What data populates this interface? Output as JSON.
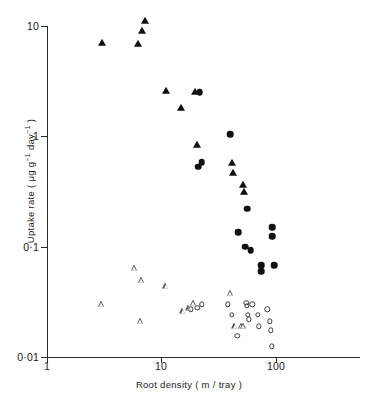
{
  "chart_data": {
    "type": "scatter",
    "title": "",
    "xlabel": "Root density ( m / tray )",
    "ylabel": "Uptake rate ( μg g⁻¹ day⁻¹ )",
    "xscale": "log",
    "yscale": "log",
    "xlim": [
      1,
      200
    ],
    "ylim": [
      0.01,
      10
    ],
    "xticks": [
      1,
      10,
      100
    ],
    "xticklabels": [
      "1",
      "10",
      "100"
    ],
    "yticks": [
      0.01,
      0.1,
      1,
      10
    ],
    "yticklabels": [
      "0·01",
      "0·1",
      "1",
      "10"
    ],
    "grid": false,
    "legend": "none",
    "series": [
      {
        "name": "filled-triangle",
        "marker": "filled-triangle",
        "color": "#111111",
        "points": [
          [
            3.0,
            7.0
          ],
          [
            6.2,
            6.9
          ],
          [
            6.8,
            9.0
          ],
          [
            7.2,
            11.0
          ],
          [
            11.0,
            2.6
          ],
          [
            14.8,
            1.8
          ],
          [
            19.5,
            2.5
          ],
          [
            20.4,
            0.83
          ],
          [
            41.0,
            0.57
          ],
          [
            42.5,
            0.47
          ],
          [
            52.0,
            0.36
          ],
          [
            52.5,
            0.31
          ]
        ]
      },
      {
        "name": "filled-circle",
        "marker": "filled-circle",
        "color": "#111111",
        "points": [
          [
            21.5,
            2.5
          ],
          [
            21.0,
            0.53
          ],
          [
            22.5,
            0.58
          ],
          [
            40.0,
            1.05
          ],
          [
            56.0,
            0.22
          ],
          [
            47.0,
            0.135
          ],
          [
            93.0,
            0.15
          ],
          [
            93.0,
            0.125
          ],
          [
            54.0,
            0.1
          ],
          [
            60.0,
            0.093
          ],
          [
            74.0,
            0.068
          ],
          [
            96.0,
            0.068
          ],
          [
            74.0,
            0.06
          ]
        ]
      },
      {
        "name": "open-triangle",
        "marker": "open-triangle",
        "color": "#555555",
        "points": [
          [
            3.0,
            0.03
          ],
          [
            5.8,
            0.064
          ],
          [
            6.7,
            0.05
          ],
          [
            6.6,
            0.021
          ],
          [
            11.0,
            0.044
          ],
          [
            15.5,
            0.026
          ],
          [
            17.5,
            0.028
          ],
          [
            19.0,
            0.031
          ],
          [
            40.0,
            0.038
          ],
          [
            44.0,
            0.019
          ],
          [
            50.0,
            0.019
          ],
          [
            52.0,
            0.019
          ]
        ]
      },
      {
        "name": "open-circle",
        "marker": "open-circle",
        "color": "#3a3a3a",
        "points": [
          [
            18.0,
            0.027
          ],
          [
            20.5,
            0.028
          ],
          [
            22.5,
            0.03
          ],
          [
            38.0,
            0.03
          ],
          [
            41.0,
            0.024
          ],
          [
            55.0,
            0.031
          ],
          [
            55.5,
            0.029
          ],
          [
            56.5,
            0.024
          ],
          [
            62.0,
            0.03
          ],
          [
            58.0,
            0.022
          ],
          [
            69.0,
            0.024
          ],
          [
            71.0,
            0.019
          ],
          [
            46.0,
            0.0155
          ],
          [
            84.0,
            0.027
          ],
          [
            88.0,
            0.021
          ],
          [
            90.0,
            0.0175
          ],
          [
            92.0,
            0.0125
          ]
        ]
      }
    ]
  },
  "axes": {
    "x_title": "Root density ( m / tray )",
    "y_title_main": "Uptake rate ( ",
    "y_title_unit_a": "μg g",
    "y_title_sup_a": "−1",
    "y_title_unit_b": " day",
    "y_title_sup_b": "−1",
    "y_title_close": " )",
    "x_tick_labels": [
      "1",
      "10",
      "100"
    ],
    "y_tick_labels": [
      "10",
      "1",
      "0·1",
      "0·01"
    ]
  }
}
